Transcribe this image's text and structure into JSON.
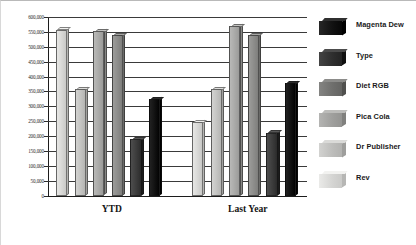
{
  "chart_data": {
    "type": "bar",
    "title": "",
    "xlabel": "",
    "ylabel": "",
    "categories": [
      "YTD",
      "Last Year"
    ],
    "ylim": [
      0,
      600000
    ],
    "ytick_step": 50000,
    "ytick_labels": [
      "600,000",
      "550,000",
      "500,000",
      "450,000",
      "400,000",
      "350,000",
      "300,000",
      "250,000",
      "200,000",
      "150,000",
      "100,000",
      "50,000",
      "0"
    ],
    "ytick_values": [
      600000,
      550000,
      500000,
      450000,
      400000,
      350000,
      300000,
      250000,
      200000,
      150000,
      100000,
      50000,
      0
    ],
    "grid": true,
    "legend_position": "right",
    "series": [
      {
        "name": "Rev",
        "color": "#d7d7d5",
        "values": [
          558000,
          248000
        ]
      },
      {
        "name": "Dr Publisher",
        "color": "#c3c3c1",
        "values": [
          358000,
          358000
        ]
      },
      {
        "name": "Pica Cola",
        "color": "#a9a9a7",
        "values": [
          552000,
          570000
        ]
      },
      {
        "name": "Diet RGB",
        "color": "#8c8c8a",
        "values": [
          540000,
          540000
        ]
      },
      {
        "name": "Type",
        "color": "#3d3d3d",
        "values": [
          190000,
          212000
        ]
      },
      {
        "name": "Magenta Dew",
        "color": "#111111",
        "values": [
          325000,
          378000
        ]
      }
    ]
  },
  "legend": {
    "items": [
      {
        "label": "Magenta Dew",
        "color": "#111111"
      },
      {
        "label": "Type",
        "color": "#2e2e2e"
      },
      {
        "label": "Diet RGB",
        "color": "#6e6e6c"
      },
      {
        "label": "Pica Cola",
        "color": "#9e9e9c"
      },
      {
        "label": "Dr Publisher",
        "color": "#bcbcba"
      },
      {
        "label": "Rev",
        "color": "#d4d4d2"
      }
    ]
  }
}
